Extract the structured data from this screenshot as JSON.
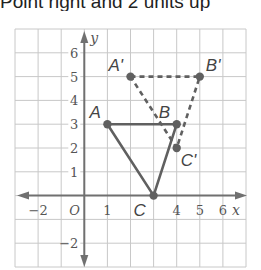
{
  "header": {
    "text": "Point right and 2 units up"
  },
  "diagram": {
    "grid": {
      "xmin": -3,
      "xmax": 7,
      "ymin": -3,
      "ymax": 7
    },
    "axes": {
      "x_label": "x",
      "y_label": "y",
      "origin_label": "O"
    },
    "x_ticks": [
      {
        "value": -2,
        "label": "−2"
      },
      {
        "value": 1,
        "label": "1"
      },
      {
        "value": 4,
        "label": "4"
      },
      {
        "value": 5,
        "label": "5"
      },
      {
        "value": 6,
        "label": "6"
      }
    ],
    "y_ticks": [
      {
        "value": 6,
        "label": "6"
      },
      {
        "value": 5,
        "label": "5"
      },
      {
        "value": 4,
        "label": "4"
      },
      {
        "value": 3,
        "label": "3"
      },
      {
        "value": 2,
        "label": "2"
      },
      {
        "value": 1,
        "label": "1"
      },
      {
        "value": -2,
        "label": "−2"
      }
    ],
    "original_triangle": {
      "style": "solid",
      "points": [
        {
          "name": "A",
          "x": 1,
          "y": 3
        },
        {
          "name": "B",
          "x": 4,
          "y": 3
        },
        {
          "name": "C",
          "x": 3,
          "y": 0
        }
      ]
    },
    "image_triangle": {
      "style": "dashed",
      "points": [
        {
          "name": "A'",
          "x": 2,
          "y": 5
        },
        {
          "name": "B'",
          "x": 5,
          "y": 5
        },
        {
          "name": "C'",
          "x": 4,
          "y": 2
        }
      ]
    },
    "colors": {
      "grid": "#c8c8c8",
      "axis": "#707070",
      "figure": "#606060",
      "text": "#555555"
    }
  }
}
